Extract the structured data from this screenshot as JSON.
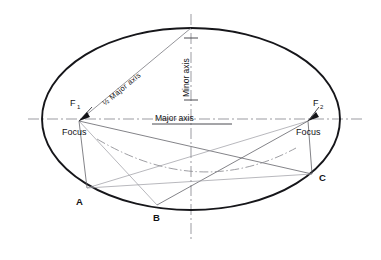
{
  "figure": {
    "type": "geometric-diagram",
    "canvas": {
      "width": 381,
      "height": 260
    },
    "colors": {
      "ellipse_stroke": "#16161a",
      "axis_stroke": "#6e6e74",
      "construction_stroke": "#5a5a60",
      "dashdot_stroke": "#8a8a90",
      "background": "#ffffff",
      "text": "#121216"
    }
  },
  "labels": {
    "major_axis": "Major axis",
    "minor_axis": "Minor axis",
    "half_major_axis": "½ Major axis",
    "focus_left": "Focus",
    "focus_right": "Focus",
    "f1": "F",
    "f1_sub": "1",
    "f2": "F",
    "f2_sub": "2",
    "point_a": "A",
    "point_b": "B",
    "point_c": "C"
  },
  "geometry": {
    "center": {
      "x": 191,
      "y": 119
    },
    "semi_major": 149,
    "semi_minor": 91,
    "focus_left": {
      "x": 79,
      "y": 121
    },
    "focus_right": {
      "x": 308,
      "y": 121
    },
    "top_vertex": {
      "x": 191,
      "y": 28
    },
    "bottom_vertex": {
      "x": 191,
      "y": 210
    },
    "point_a": {
      "x": 87,
      "y": 188
    },
    "point_b": {
      "x": 157,
      "y": 205
    },
    "point_c": {
      "x": 312,
      "y": 174
    },
    "major_axis_extent": {
      "x1": 28,
      "x2": 362,
      "y": 119
    },
    "minor_axis_extent": {
      "x": 191,
      "y1": 14,
      "y2": 240
    }
  }
}
